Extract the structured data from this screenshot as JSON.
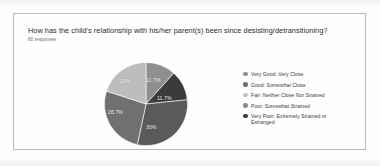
{
  "card": {
    "title": "How has the child's relationship with his/her parent(s) been since desisting/detransitioning?",
    "subtitle": "60 responses"
  },
  "chart_data": {
    "type": "pie",
    "title": "How has the child's relationship with his/her parent(s) been since desisting/detransitioning?",
    "subtitle": "60 responses",
    "total_responses": 60,
    "legend_position": "right",
    "categories": [
      "Very Good: Very Close",
      "Good: Somewhat Close",
      "Fair: Neither Close Nor Strained",
      "Poor: Somewhat Strained",
      "Very Poor: Extremely Strained or Estranged"
    ],
    "values": [
      11.7,
      11.7,
      30,
      26.7,
      20
    ],
    "value_labels": [
      "11.7%",
      "11.7%",
      "30%",
      "26.7%",
      "20%"
    ],
    "colors": [
      "#8f8f8f",
      "#3b3b3b",
      "#5a5a5a",
      "#707070",
      "#bdbdbd"
    ],
    "legend_dot_colors": [
      "#8f8f8f",
      "#6e6e6e",
      "#c4c4c4",
      "#898989",
      "#3b3b3b"
    ],
    "start_angle_deg": 0,
    "direction": "clockwise"
  },
  "legend": {
    "items": [
      {
        "label": "Very Good: Very Close",
        "label_line2": ""
      },
      {
        "label": "Good: Somewhat Close",
        "label_line2": ""
      },
      {
        "label": "Fair: Neither Close Nor Strained",
        "label_line2": ""
      },
      {
        "label": "Poor: Somewhat Strained",
        "label_line2": ""
      },
      {
        "label": "Very Poor: Extremely Strained or",
        "label_line2": "Estranged"
      }
    ]
  },
  "slice_labels": [
    {
      "text": "11.7%",
      "x": 46,
      "y": 16,
      "tone": "light"
    },
    {
      "text": "11.7%",
      "x": 57,
      "y": 34,
      "tone": "dark"
    },
    {
      "text": "30%",
      "x": 46,
      "y": 63,
      "tone": "dark"
    },
    {
      "text": "26.7%",
      "x": 8,
      "y": 48,
      "tone": "light"
    },
    {
      "text": "20%",
      "x": 20,
      "y": 17,
      "tone": "light"
    }
  ]
}
